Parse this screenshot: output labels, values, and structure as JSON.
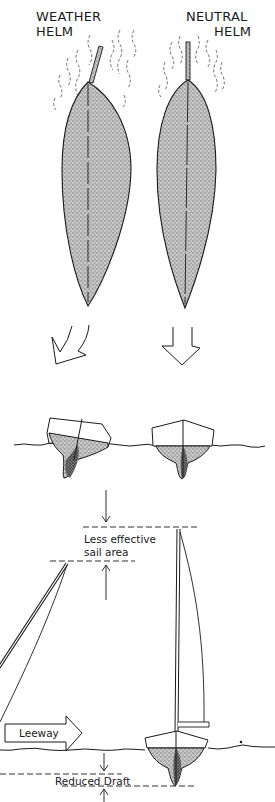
{
  "diagram": {
    "top_labels": {
      "left_line1": "WEATHER",
      "left_line2": "HELM",
      "right_line1": "NEUTRAL",
      "right_line2": "HELM"
    },
    "annotations": {
      "sail_area_line1": "Less effective",
      "sail_area_line2": "sail area",
      "leeway": "Leeway",
      "reduced_draft": "Reduced Draft"
    },
    "panels": [
      {
        "name": "weather-helm-plan-view",
        "description": "Hull plan view with rudder angled, wind streaks around bow"
      },
      {
        "name": "neutral-helm-plan-view",
        "description": "Hull plan view with rudder centered, wind streaks around bow"
      },
      {
        "name": "heeled-hull-section",
        "description": "Heeled boat cross-section with keel angled"
      },
      {
        "name": "upright-hull-section",
        "description": "Upright boat cross-section"
      },
      {
        "name": "heeled-mast-sail",
        "description": "Leaning mast and sail, lower effective height"
      },
      {
        "name": "upright-mast-sail",
        "description": "Upright mast and sail on hull"
      }
    ],
    "colors": {
      "ink": "#1a1a1a",
      "stipple": "#8a8a8a",
      "background": "#ffffff"
    }
  }
}
